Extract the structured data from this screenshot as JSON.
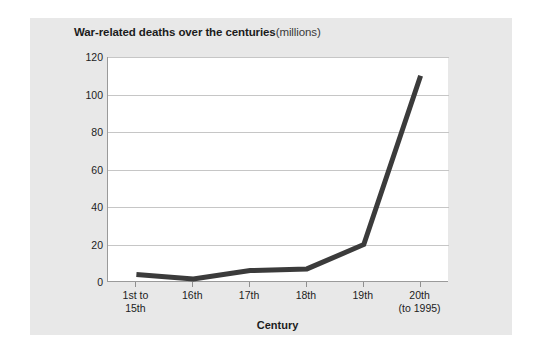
{
  "figure": {
    "title_main": "War-related deaths over the centuries",
    "title_units": "(millions)"
  },
  "chart_data": {
    "type": "line",
    "xlabel": "Century",
    "ylabel": "",
    "categories": [
      "1st to 15th",
      "16th",
      "17th",
      "18th",
      "19th",
      "20th (to 1995)"
    ],
    "category_lines": [
      [
        "1st to",
        "15th"
      ],
      [
        "16th"
      ],
      [
        "17th"
      ],
      [
        "18th"
      ],
      [
        "19th"
      ],
      [
        "20th",
        "(to 1995)"
      ]
    ],
    "values": [
      4,
      1.6,
      6.1,
      7,
      20,
      110
    ],
    "ylim": [
      0,
      120
    ],
    "yticks": [
      0,
      20,
      40,
      60,
      80,
      100,
      120
    ],
    "ytick_labels": [
      "0",
      "20",
      "40",
      "60",
      "80",
      "100",
      "120"
    ],
    "grid": true,
    "legend": false,
    "line_color": "#3b3b3b",
    "plot_background": "#ffffff",
    "figure_background": "#e8e8e8",
    "gridline_color": "#c6c6c6"
  }
}
